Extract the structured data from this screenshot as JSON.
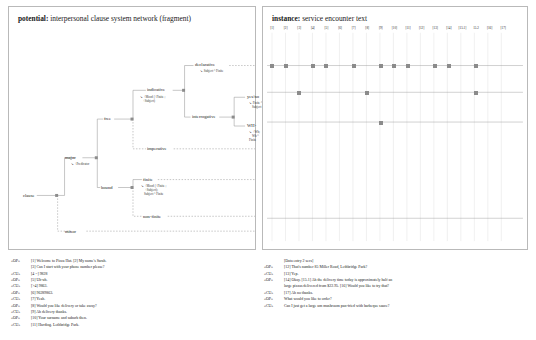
{
  "potential": {
    "title_bold": "potential:",
    "title_rest": " interpersonal clause system network (fragment)",
    "nodes": [
      {
        "id": "clause",
        "label": "clause",
        "x": 14,
        "y": 190
      },
      {
        "id": "major",
        "label": "major",
        "x": 56,
        "y": 152
      },
      {
        "id": "minor",
        "label": "minor",
        "x": 56,
        "y": 226
      },
      {
        "id": "free",
        "label": "free",
        "x": 97,
        "y": 113
      },
      {
        "id": "bound",
        "label": "bound",
        "x": 94,
        "y": 182
      },
      {
        "id": "indicative",
        "label": "indicative",
        "x": 140,
        "y": 84
      },
      {
        "id": "imperative",
        "label": "imperative",
        "x": 140,
        "y": 143
      },
      {
        "id": "declarative",
        "label": "declarative",
        "x": 188,
        "y": 59
      },
      {
        "id": "interrogative",
        "label": "interrogative",
        "x": 185,
        "y": 111
      },
      {
        "id": "yesno",
        "label": "yes/no",
        "x": 240,
        "y": 91
      },
      {
        "id": "wh",
        "label": "WH-",
        "x": 240,
        "y": 120
      },
      {
        "id": "finite",
        "label": "finite",
        "x": 136,
        "y": 174
      },
      {
        "id": "nonfinite",
        "label": "non-finite",
        "x": 136,
        "y": 211
      }
    ],
    "realizations": [
      {
        "id": "major-real",
        "text": "↘ +Predicator",
        "x": 62,
        "y": 159
      },
      {
        "id": "indicative-real",
        "line1": "↘ +Mood (+Finite ;",
        "line2": "+Subject)",
        "x": 131,
        "y": 92
      },
      {
        "id": "declarative-real",
        "text": "↘ Subject ^ Finite",
        "x": 192,
        "y": 66
      },
      {
        "id": "yesno-real",
        "line1": "↘ Finite ^",
        "line2": "Subject",
        "x": 240,
        "y": 97
      },
      {
        "id": "wh-real",
        "line1": "↘ +Wh;",
        "line2": "Wh ^",
        "line3": "Finite",
        "x": 240,
        "y": 126
      },
      {
        "id": "finite-real",
        "line1": "↘ +Mood (+Finite ;",
        "line2": "+Subject);",
        "line3": "Subject ^ Finite",
        "x": 140,
        "y": 180
      }
    ]
  },
  "instance": {
    "title_bold": "instance:",
    "title_rest": " service encounter text",
    "columns": [
      "[1]",
      "[2]",
      "[3]",
      "[4]",
      "[5]",
      "[6]",
      "[7]",
      "[8]",
      "[9]",
      "[10]",
      "[11]",
      "[12]",
      "[13]",
      "[14]",
      "[15.1]",
      "15.2",
      "[16]",
      "[17]"
    ],
    "rows": [
      {
        "name": "declarative-row",
        "y": 65,
        "cells": [
          1,
          2,
          4,
          5,
          7,
          9,
          10,
          11,
          13,
          14,
          16
        ]
      },
      {
        "name": "yesno-row",
        "y": 92,
        "cells": [
          3,
          8,
          16
        ]
      },
      {
        "name": "wh-row",
        "y": 122,
        "cells": [
          9
        ]
      }
    ]
  },
  "left_transcript": [
    {
      "speaker": "«OP»",
      "text": "[1] Welcome to Pizza Hut. [2] My name's Sarah."
    },
    {
      "speaker": "",
      "text": "[3] Can I start with your phone number please?",
      "cont": true
    },
    {
      "speaker": "«CU»",
      "text": "[4 =] 9828"
    },
    {
      "speaker": "«OP»",
      "text": "[5] Uh-uh."
    },
    {
      "speaker": "«CU»",
      "text": "[>4] 9863."
    },
    {
      "speaker": "«OP»",
      "text": "[6] 96289863."
    },
    {
      "speaker": "«CU»",
      "text": "[7] Yeah."
    },
    {
      "speaker": "«OP»",
      "text": "[8] Would you like delivery or take away?"
    },
    {
      "speaker": "«CU»",
      "text": "[9] Ah delivery thanks."
    },
    {
      "speaker": "«OP»",
      "text": "[10] Your surname and suburb then."
    },
    {
      "speaker": "«CU»",
      "text": "[11] Harding. Lethbridge Park."
    }
  ],
  "right_transcript": [
    {
      "speaker": "",
      "text": "[Data entry 2 secs]",
      "stage": true
    },
    {
      "speaker": "«OP»",
      "text": "[12] That's number 85 Miller Road, Lethbridge Park?"
    },
    {
      "speaker": "«CU»",
      "text": "[13] Yep."
    },
    {
      "speaker": "«OP»",
      "text": "[14] Okay. [15.1] Ah the delivery time today is approximately half an"
    },
    {
      "speaker": "",
      "text": "large pizzas delivered from $22.95. [16] Would you like to try that?",
      "cont": true
    },
    {
      "speaker": "«CU»",
      "text": "[17] Ah no thanks."
    },
    {
      "speaker": "«OP»",
      "text": "What would you like to order?"
    },
    {
      "speaker": "«CU»",
      "text": "Can I just get a large um mushroom pan-fried with barbeque sauce?"
    }
  ]
}
